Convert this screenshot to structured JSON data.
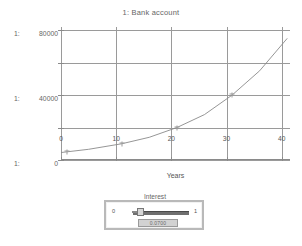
{
  "chart_data": {
    "type": "line",
    "title": "1: Bank account",
    "xlabel": "Years",
    "ylabel": "",
    "xlim": [
      0,
      41.5
    ],
    "ylim": [
      0,
      82000
    ],
    "grid": true,
    "legend": "none",
    "x_ticks": [
      "0",
      "10",
      "20",
      "30",
      "40"
    ],
    "x_tick_values": [
      0,
      10,
      20,
      30,
      40
    ],
    "y_ticks": [
      "0",
      "40000",
      "80000"
    ],
    "y_tick_values": [
      0,
      40000,
      80000
    ],
    "y_gridline_values": [
      0,
      20000,
      40000,
      60000,
      80000
    ],
    "y_axis_label_prefix": "1:",
    "y_axis_labels": [
      {
        "prefix": "1:",
        "value": "80000"
      },
      {
        "prefix": "1:",
        "value": "40000"
      },
      {
        "prefix": "1:",
        "value": "0"
      }
    ],
    "series": [
      {
        "name": "1: Bank account",
        "color": "#8a8a8a",
        "x": [
          0,
          1,
          5,
          11,
          16,
          21,
          26,
          31,
          36,
          41
        ],
        "y": [
          4600,
          5000,
          6600,
          10000,
          14000,
          20000,
          28000,
          40000,
          55000,
          75000
        ]
      }
    ],
    "markers": [
      {
        "x": 1,
        "y": 5000
      },
      {
        "x": 11,
        "y": 10000
      },
      {
        "x": 21,
        "y": 20000
      },
      {
        "x": 31,
        "y": 40000
      }
    ]
  },
  "slider": {
    "label": "Interest",
    "min_label": "0",
    "max_label": "1",
    "value_display": "0.0700",
    "value": 0.07
  },
  "footer": {
    "caption": ""
  }
}
